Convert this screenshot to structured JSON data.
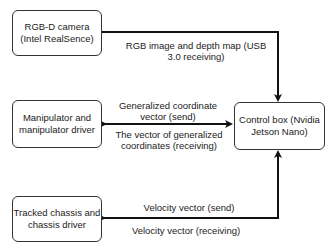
{
  "nodes": {
    "camera": {
      "line1": "RGB-D camera",
      "line2": "(Intel RealSence)"
    },
    "manipulator": {
      "line1": "Manipulator and",
      "line2": "manipulator driver"
    },
    "chassis": {
      "line1": "Tracked chassis and",
      "line2": "chassis driver"
    },
    "control": {
      "line1": "Control box (Nvidia",
      "line2": "Jetson Nano)"
    }
  },
  "edges": {
    "camera_to_control": {
      "line1": "RGB image and depth map (USB",
      "line2": "3.0 receiving)"
    },
    "manipulator_control": {
      "send_line1": "Generalized coordinate",
      "send_line2": "vector (send)",
      "recv_line1": "The vector of generalized",
      "recv_line2": "coordinates (receiving)"
    },
    "chassis_control": {
      "send": "Velocity vector (send)",
      "recv": "Velocity vector (receiving)"
    }
  },
  "colors": {
    "stroke": "#111111",
    "box_border": "#333333"
  }
}
